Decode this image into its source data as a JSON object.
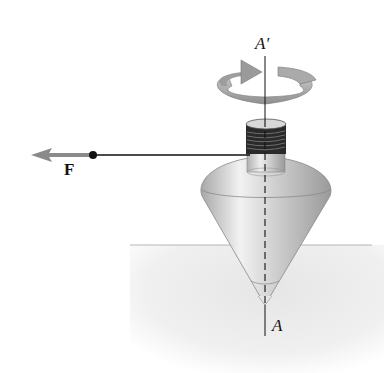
{
  "figure": {
    "labels": {
      "axis_top": "A′",
      "axis_bottom": "A",
      "force": "F"
    },
    "colors": {
      "background": "#ffffff",
      "ground": "#ececec",
      "top_body": "#c8c8c8",
      "arrow_ring": "#a9a9a9",
      "force_arrow": "#8a8a8a",
      "line": "#111111"
    }
  }
}
